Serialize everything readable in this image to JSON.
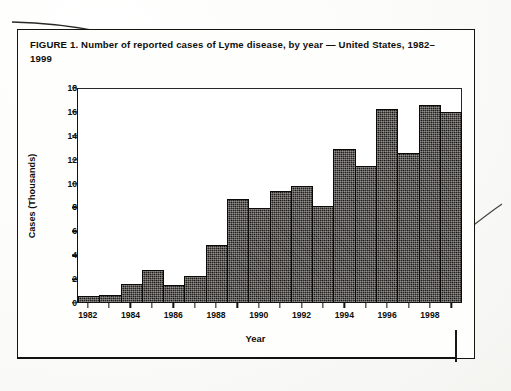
{
  "document": {
    "figure_title": "FIGURE 1. Number of reported cases of Lyme disease, by year — United States, 1982–1999"
  },
  "chart_data": {
    "type": "bar",
    "title": "FIGURE 1. Number of reported cases of Lyme disease, by year — United States, 1982–1999",
    "xlabel": "Year",
    "ylabel": "Cases (Thousands)",
    "categories": [
      "1982",
      "1983",
      "1984",
      "1985",
      "1986",
      "1987",
      "1988",
      "1989",
      "1990",
      "1991",
      "1992",
      "1993",
      "1994",
      "1995",
      "1996",
      "1997",
      "1998",
      "1999"
    ],
    "values": [
      0.5,
      0.6,
      1.5,
      2.7,
      1.4,
      2.2,
      4.8,
      8.6,
      7.9,
      9.3,
      9.7,
      8.0,
      12.8,
      11.4,
      16.2,
      12.5,
      16.5,
      15.9
    ],
    "ylim": [
      0,
      18
    ],
    "yticks": [
      0,
      2,
      4,
      6,
      8,
      10,
      12,
      14,
      16,
      18
    ],
    "xtick_labels": [
      "1982",
      "1984",
      "1986",
      "1988",
      "1990",
      "1992",
      "1994",
      "1996",
      "1998"
    ],
    "xtick_categories": [
      "1982",
      "1984",
      "1986",
      "1988",
      "1990",
      "1992",
      "1994",
      "1996",
      "1998"
    ],
    "grid": false,
    "legend": null,
    "bar_color": "#2a2723",
    "bar_edge_color": "#0b0a09",
    "axis_color": "#131210",
    "background_color": "#ffffff"
  }
}
